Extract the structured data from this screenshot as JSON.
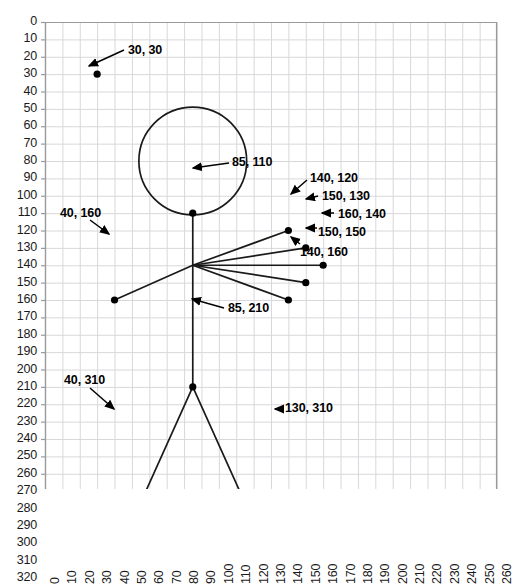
{
  "figure": {
    "title": "",
    "background": "#ffffff",
    "grid_color": "#d8d8dc",
    "axis_color": "#9a9a9e",
    "stroke_color": "#1a1a1a",
    "point_color": "#000000"
  },
  "axes": {
    "x": {
      "label": "",
      "min": 0,
      "max": 260,
      "step": 10,
      "ticks": [
        "0",
        "10",
        "20",
        "30",
        "40",
        "50",
        "60",
        "70",
        "80",
        "90",
        "100",
        "110",
        "120",
        "130",
        "140",
        "150",
        "160",
        "170",
        "180",
        "190",
        "200",
        "210",
        "220",
        "230",
        "240",
        "250",
        "260"
      ],
      "orientation": "rotated-90"
    },
    "y": {
      "label": "",
      "min": 0,
      "max": 320,
      "step": 10,
      "inverted": true,
      "ticks": [
        "0",
        "10",
        "20",
        "30",
        "40",
        "50",
        "60",
        "70",
        "80",
        "90",
        "100",
        "110",
        "120",
        "130",
        "140",
        "150",
        "160",
        "170",
        "180",
        "190",
        "200",
        "210",
        "220",
        "230",
        "240",
        "250",
        "260",
        "270",
        "280",
        "290",
        "300",
        "310",
        "320"
      ]
    }
  },
  "chart_data": {
    "type": "scatter",
    "title": "",
    "xlabel": "",
    "ylabel": "",
    "xlim": [
      0,
      260
    ],
    "ylim": [
      320,
      0
    ],
    "grid": true,
    "legend": null,
    "points": [
      {
        "label": "30, 30",
        "x": 30,
        "y": 30
      },
      {
        "label": "85, 110",
        "x": 85,
        "y": 110
      },
      {
        "label": "40, 160",
        "x": 40,
        "y": 160
      },
      {
        "label": "140, 120",
        "x": 140,
        "y": 120
      },
      {
        "label": "150, 130",
        "x": 150,
        "y": 130
      },
      {
        "label": "160, 140",
        "x": 160,
        "y": 140
      },
      {
        "label": "150, 150",
        "x": 150,
        "y": 150
      },
      {
        "label": "140, 160",
        "x": 140,
        "y": 160
      },
      {
        "label": "85, 210",
        "x": 85,
        "y": 210
      },
      {
        "label": "40, 310",
        "x": 40,
        "y": 310
      },
      {
        "label": "130, 310",
        "x": 130,
        "y": 310
      }
    ],
    "shapes": [
      {
        "kind": "circle",
        "name": "head",
        "cx": 85,
        "cy": 80,
        "r": 31
      },
      {
        "kind": "line",
        "name": "spine",
        "x1": 85,
        "y1": 110,
        "x2": 85,
        "y2": 210
      },
      {
        "kind": "line",
        "name": "arm-upper-left",
        "x1": 85,
        "y1": 140,
        "x2": 140,
        "y2": 120
      },
      {
        "kind": "line",
        "name": "arm-mid-upper",
        "x1": 85,
        "y1": 140,
        "x2": 150,
        "y2": 130
      },
      {
        "kind": "line",
        "name": "arm-horizontal",
        "x1": 85,
        "y1": 140,
        "x2": 160,
        "y2": 140
      },
      {
        "kind": "line",
        "name": "arm-mid-lower",
        "x1": 85,
        "y1": 140,
        "x2": 150,
        "y2": 150
      },
      {
        "kind": "line",
        "name": "arm-lower-right",
        "x1": 85,
        "y1": 140,
        "x2": 140,
        "y2": 160
      },
      {
        "kind": "line",
        "name": "arm-left",
        "x1": 85,
        "y1": 140,
        "x2": 40,
        "y2": 160
      },
      {
        "kind": "line",
        "name": "leg-left",
        "x1": 85,
        "y1": 210,
        "x2": 40,
        "y2": 310
      },
      {
        "kind": "line",
        "name": "leg-right",
        "x1": 85,
        "y1": 210,
        "x2": 130,
        "y2": 310
      }
    ],
    "annotations": [
      {
        "text": "30, 30",
        "tx": 128,
        "ty": 44,
        "ax": 89,
        "ay": 66,
        "px": 124,
        "py": 50
      },
      {
        "text": "85, 110",
        "tx": 232,
        "ty": 156,
        "ax": 193,
        "ay": 168,
        "px": 229,
        "py": 163
      },
      {
        "text": "40, 160",
        "tx": 60,
        "ty": 207,
        "ax": 109,
        "ay": 234,
        "px": 90,
        "py": 220
      },
      {
        "text": "140, 120",
        "tx": 310,
        "ty": 172,
        "ax": 291,
        "ay": 194,
        "px": 307,
        "py": 180
      },
      {
        "text": "150, 130",
        "tx": 322,
        "ty": 190,
        "ax": 306,
        "ay": 199,
        "px": 318,
        "py": 196
      },
      {
        "text": "160, 140",
        "tx": 338,
        "ty": 208,
        "ax": 322,
        "ay": 213,
        "px": 334,
        "py": 213
      },
      {
        "text": "150, 150",
        "tx": 318,
        "ty": 226,
        "ax": 306,
        "ay": 228,
        "px": 317,
        "py": 228
      },
      {
        "text": "140, 160",
        "tx": 300,
        "ty": 246,
        "ax": 291,
        "ay": 237,
        "px": 300,
        "py": 244
      },
      {
        "text": "85, 210",
        "tx": 228,
        "ty": 302,
        "ax": 192,
        "ay": 299,
        "px": 224,
        "py": 308
      },
      {
        "text": "40, 310",
        "tx": 64,
        "ty": 374,
        "ax": 114,
        "ay": 409,
        "px": 90,
        "py": 388
      },
      {
        "text": "130, 310",
        "tx": 285,
        "ty": 402,
        "ax": 275,
        "ay": 409,
        "px": 283,
        "py": 409
      }
    ]
  },
  "plot_geometry": {
    "origin_x_px": 45,
    "origin_y_px": 22,
    "scale_x": 1.7385,
    "scale_y": 1.7375
  }
}
